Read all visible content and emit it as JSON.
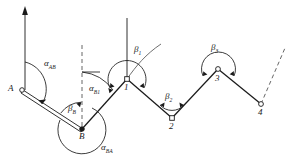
{
  "figure": {
    "type": "kinematic-linkage-diagram",
    "background": "#ffffff",
    "stroke_color": "#1a1a1a",
    "dash_color": "#555555"
  },
  "points": {
    "A": {
      "label": "A",
      "x": 22,
      "y": 90
    },
    "B": {
      "label": "B",
      "x": 82,
      "y": 129
    },
    "n1": {
      "label": "1",
      "x": 127,
      "y": 79
    },
    "n2": {
      "label": "2",
      "x": 172,
      "y": 118
    },
    "n3": {
      "label": "3",
      "x": 218,
      "y": 69
    },
    "n4": {
      "label": "4",
      "x": 261,
      "y": 104
    }
  },
  "angles": {
    "alpha_AB": {
      "symbol": "α",
      "sub": "AB"
    },
    "alpha_B1": {
      "symbol": "α",
      "sub": "B1"
    },
    "alpha_BA": {
      "symbol": "α",
      "sub": "BA"
    },
    "beta_B": {
      "symbol": "β",
      "sub": "B"
    },
    "beta_1": {
      "symbol": "β",
      "sub": "1"
    },
    "beta_2": {
      "symbol": "β",
      "sub": "2"
    },
    "beta_3": {
      "symbol": "β",
      "sub": "3"
    }
  },
  "node_labels": {
    "A": "A",
    "B": "B",
    "one": "1",
    "two": "2",
    "three": "3",
    "four": "4"
  }
}
